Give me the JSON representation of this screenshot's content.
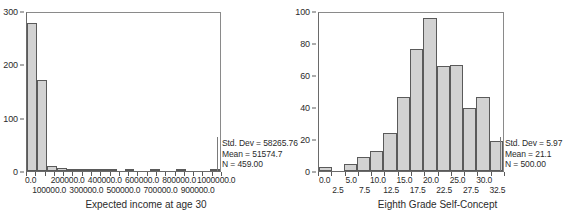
{
  "chart_data": [
    {
      "type": "bar",
      "title": "",
      "xlabel": "Expected income at age 30",
      "ylabel": "",
      "ylim": [
        0,
        300
      ],
      "yticks": [
        "0",
        "100",
        "200",
        "300"
      ],
      "ytick_values": [
        0,
        100,
        200,
        300
      ],
      "xticks_row1": [
        "0.0",
        "200000.0",
        "400000.0",
        "600000.0",
        "800000.0",
        "1000000.0"
      ],
      "xticks_row2": [
        "100000.0",
        "300000.0",
        "500000.0",
        "700000.0",
        "900000.0"
      ],
      "bin_width": 50000,
      "categories": [
        "0",
        "50000",
        "100000",
        "150000",
        "200000",
        "250000",
        "300000",
        "350000",
        "400000",
        "450000",
        "500000",
        "550000",
        "600000",
        "650000",
        "700000",
        "750000",
        "800000",
        "850000",
        "900000",
        "950000",
        "1000000"
      ],
      "values": [
        278,
        170,
        9,
        5,
        3,
        1,
        1,
        1,
        1,
        0,
        1,
        0,
        0,
        1,
        0,
        0,
        1,
        0,
        0,
        0,
        1
      ],
      "grid": false,
      "legend": "none",
      "stats": {
        "std_dev_label": "Std. Dev = 58265.76",
        "mean_label": "Mean = 51574.7",
        "n_label": "N = 459.00"
      }
    },
    {
      "type": "bar",
      "title": "",
      "xlabel": "Eighth Grade Self-Concept",
      "ylabel": "",
      "ylim": [
        0,
        100
      ],
      "yticks": [
        "0",
        "20",
        "40",
        "60",
        "80",
        "100"
      ],
      "ytick_values": [
        0,
        20,
        40,
        60,
        80,
        100
      ],
      "xticks_row1": [
        "0.0",
        "5.0",
        "10.0",
        "15.0",
        "20.0",
        "25.0",
        "30.0"
      ],
      "xticks_row2": [
        "2.5",
        "7.5",
        "12.5",
        "17.5",
        "22.5",
        "27.5",
        "32.5"
      ],
      "bin_width": 2.5,
      "categories": [
        "0.0",
        "2.5",
        "5.0",
        "7.5",
        "10.0",
        "12.5",
        "15.0",
        "17.5",
        "20.0",
        "22.5",
        "25.0",
        "27.5",
        "30.0",
        "32.5"
      ],
      "values": [
        2.5,
        0,
        4.5,
        8.5,
        12.5,
        23.5,
        46.5,
        76,
        95.5,
        65.5,
        66,
        39.5,
        46.5,
        18.5
      ],
      "grid": false,
      "legend": "none",
      "stats": {
        "std_dev_label": "Std. Dev = 5.97",
        "mean_label": "Mean = 21.1",
        "n_label": "N = 500.00"
      }
    }
  ],
  "left_panel": {
    "axis_title": "Expected income at age 30",
    "y_ticks": [
      "300",
      "200",
      "100",
      "0"
    ],
    "x_row1": [
      "0.0",
      "200000.0",
      "400000.0",
      "600000.0",
      "800000.0",
      "1000000.0"
    ],
    "x_row2": [
      "100000.0",
      "300000.0",
      "500000.0",
      "700000.0",
      "900000.0"
    ],
    "stats": {
      "std_dev": "Std. Dev = 58265.76",
      "mean": "Mean = 51574.7",
      "n": "N = 459.00"
    }
  },
  "right_panel": {
    "axis_title": "Eighth Grade Self-Concept",
    "y_ticks": [
      "100",
      "80",
      "60",
      "40",
      "20",
      "0"
    ],
    "x_row1": [
      "0.0",
      "5.0",
      "10.0",
      "15.0",
      "20.0",
      "25.0",
      "30.0"
    ],
    "x_row2": [
      "2.5",
      "7.5",
      "12.5",
      "17.5",
      "22.5",
      "27.5",
      "32.5"
    ],
    "stats": {
      "std_dev": "Std. Dev = 5.97",
      "mean": "Mean = 21.1",
      "n": "N = 500.00"
    }
  },
  "colors": {
    "bar_fill": "#d2d2d2",
    "bar_stroke": "#5a5a5a",
    "axis": "#5a5a5a",
    "text": "#2b2b2b",
    "background": "#ffffff"
  }
}
